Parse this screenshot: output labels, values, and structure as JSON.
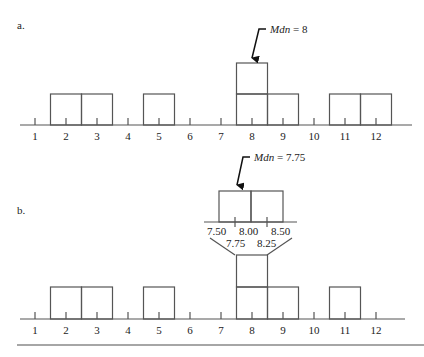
{
  "panel_a": {
    "label": "a.",
    "median_annotation": "Mdn = 8",
    "median_prefix": "Mdn",
    "median_value": "= 8",
    "ticks": [
      "1",
      "2",
      "3",
      "4",
      "5",
      "6",
      "7",
      "8",
      "9",
      "10",
      "11",
      "12"
    ],
    "stacks": [
      0,
      1,
      1,
      0,
      1,
      0,
      0,
      2,
      1,
      0,
      1,
      1
    ]
  },
  "panel_b": {
    "label": "b.",
    "median_annotation": "Mdn = 7.75",
    "median_prefix": "Mdn",
    "median_value": "= 7.75",
    "ticks": [
      "1",
      "2",
      "3",
      "4",
      "5",
      "6",
      "7",
      "8",
      "9",
      "10",
      "11",
      "12"
    ],
    "stacks": [
      0,
      1,
      1,
      0,
      1,
      0,
      0,
      2,
      1,
      0,
      1,
      0
    ],
    "zoom_upper_labels": [
      "7.50",
      "8.00",
      "8.50"
    ],
    "zoom_lower_labels": [
      "7.75",
      "8.25"
    ]
  },
  "chart_data": [
    {
      "type": "bar",
      "title": "a.",
      "categories": [
        1,
        2,
        3,
        4,
        5,
        6,
        7,
        8,
        9,
        10,
        11,
        12
      ],
      "values": [
        0,
        1,
        1,
        0,
        1,
        0,
        0,
        2,
        1,
        0,
        1,
        1
      ],
      "annotations": [
        "Mdn = 8 (arrow pointing to the stacked boxes at 8)"
      ],
      "xlabel": "",
      "ylabel": "",
      "grid": false
    },
    {
      "type": "bar",
      "title": "b.",
      "categories": [
        1,
        2,
        3,
        4,
        5,
        6,
        7,
        8,
        9,
        10,
        11,
        12
      ],
      "values": [
        0,
        1,
        1,
        0,
        1,
        0,
        0,
        2,
        1,
        0,
        1,
        0
      ],
      "annotations": [
        "Mdn = 7.75 (arrow pointing to left half of expanded interval)",
        "Expanded interval 7.50–8.50 with ticks 7.50, 8.00, 8.50 and midpoints 7.75, 8.25"
      ],
      "xlabel": "",
      "ylabel": "",
      "grid": false
    }
  ]
}
